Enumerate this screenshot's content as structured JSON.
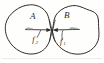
{
  "figure": {
    "kind": "physics-diagram",
    "caption": "",
    "background_color": "#fefefd",
    "ink_color": "#2b2b28"
  },
  "bodies": [
    {
      "id": "body-a",
      "label": "A",
      "side": "left",
      "shape": "irregular-blob"
    },
    {
      "id": "body-b",
      "label": "B",
      "side": "right",
      "shape": "irregular-blob"
    }
  ],
  "contact_point": {
    "label": "",
    "x": 52,
    "y": 30
  },
  "forces": [
    {
      "id": "force-f2",
      "label": "f",
      "subscript": "2",
      "direction": "right",
      "acts_on": "B",
      "origin_body": "A",
      "tag": "smooth"
    },
    {
      "id": "force-f1",
      "label": "f",
      "subscript": "1",
      "direction": "left",
      "acts_on": "A",
      "origin_body": "B",
      "tag": "smooth"
    }
  ],
  "colors": {
    "ink": "#2b2b28",
    "paper": "#fefefd",
    "smudge": "#9a9a93"
  }
}
